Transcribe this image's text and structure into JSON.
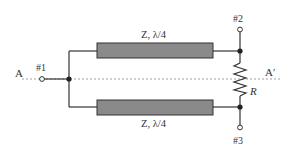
{
  "diagram": {
    "type": "wilkinson-power-divider",
    "axis": {
      "start_label": "A",
      "end_label": "A′"
    },
    "ports": [
      {
        "id": "port-1",
        "label": "#1"
      },
      {
        "id": "port-2",
        "label": "#2"
      },
      {
        "id": "port-3",
        "label": "#3"
      }
    ],
    "lines": [
      {
        "id": "upper-line",
        "label": "Z, λ/4"
      },
      {
        "id": "lower-line",
        "label": "Z, λ/4"
      }
    ],
    "resistor": {
      "label": "R"
    },
    "colors": {
      "stroke": "#333333",
      "line_fill": "#8a8a8a",
      "dashed_axis": "#888888"
    }
  }
}
